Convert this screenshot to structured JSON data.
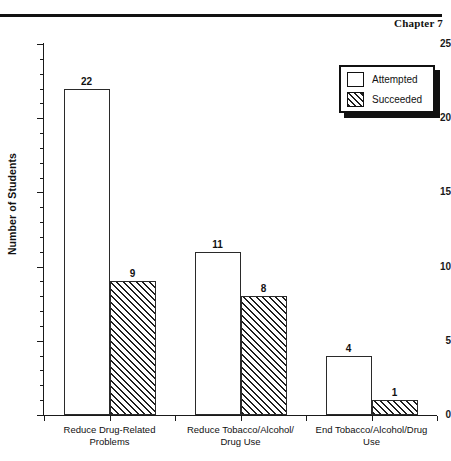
{
  "header": {
    "chapter_label": "Chapter 7"
  },
  "legend": {
    "entries": [
      {
        "label": "Attempted",
        "swatch": "open-square-icon"
      },
      {
        "label": "Succeeded",
        "swatch": "hatched-square-icon"
      }
    ]
  },
  "axes": {
    "y_title": "Number of Students",
    "y_major_ticks": [
      "0",
      "5",
      "10",
      "15",
      "20",
      "25"
    ]
  },
  "chart_data": {
    "type": "bar",
    "title": "",
    "xlabel": "",
    "ylabel": "Number of Students",
    "ylim": [
      0,
      25
    ],
    "ytick_step_major": 5,
    "ytick_step_minor": 1,
    "grid": false,
    "legend_position": "top-right",
    "categories": [
      "Reduce Drug-Related Problems",
      "Reduce Tobacco/Alcohol/ Drug Use",
      "End Tobacco/Alcohol/Drug Use"
    ],
    "category_lines": [
      [
        "Reduce Drug-Related",
        "Problems"
      ],
      [
        "Reduce Tobacco/Alcohol/",
        "Drug Use"
      ],
      [
        "End Tobacco/Alcohol/Drug",
        "Use"
      ]
    ],
    "series": [
      {
        "name": "Attempted",
        "values": [
          22,
          11,
          4
        ]
      },
      {
        "name": "Succeeded",
        "values": [
          9,
          8,
          1
        ]
      }
    ],
    "data_labels": [
      "22",
      "9",
      "11",
      "8",
      "4",
      "1"
    ]
  },
  "colors": {
    "ink": "#111111",
    "bar_fill": "#ffffff",
    "bar_edge": "#2a2a2a",
    "hatch": "#1f1f1f",
    "page_background": "#ffffff"
  }
}
